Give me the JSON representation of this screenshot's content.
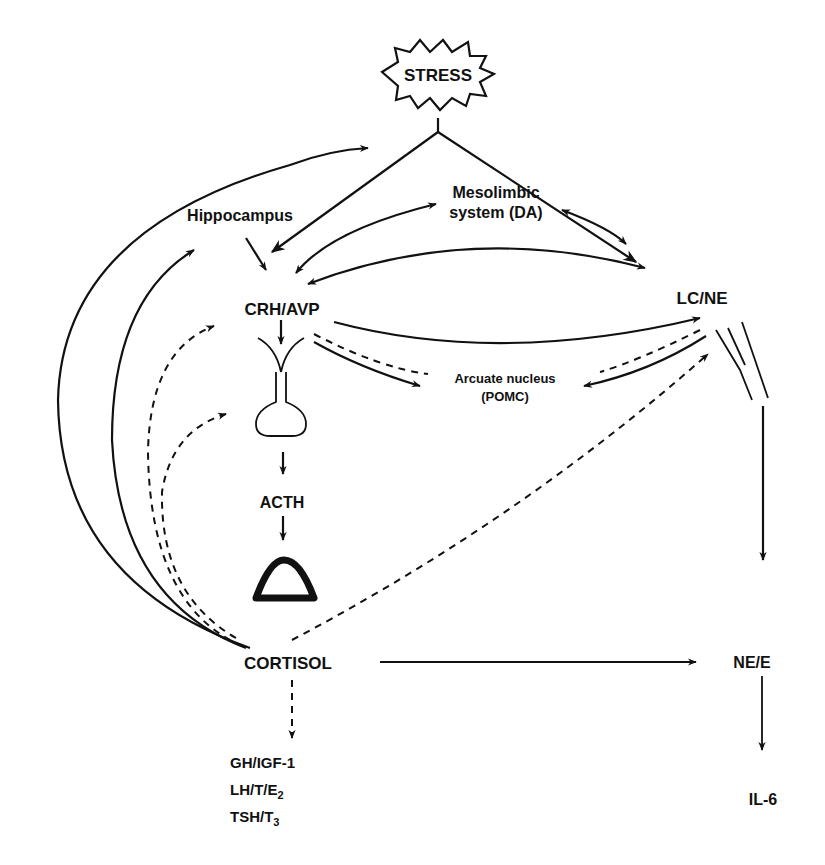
{
  "diagram": {
    "nodes": {
      "stress": "STRESS",
      "mesolimbic_line1": "Mesolimbic",
      "mesolimbic_line2": "system (DA)",
      "hippocampus": "Hippocampus",
      "crh_avp": "CRH/AVP",
      "lc_ne": "LC/NE",
      "arcuate_line1": "Arcuate nucleus",
      "arcuate_line2": "(POMC)",
      "acth": "ACTH",
      "cortisol": "CORTISOL",
      "ne_e": "NE/E",
      "il6": "IL-6",
      "gh_igf": "GH/IGF-1",
      "lh_base": "LH/T/E",
      "lh_sub": "2",
      "tsh_base": "TSH/T",
      "tsh_sub": "3"
    },
    "edges": [
      {
        "from": "STRESS",
        "to": "CRH/AVP",
        "style": "solid"
      },
      {
        "from": "STRESS",
        "to": "LC/NE",
        "style": "solid"
      },
      {
        "from": "Hippocampus",
        "to": "CRH/AVP",
        "style": "solid"
      },
      {
        "from": "Mesolimbic system (DA)",
        "to": "CRH/AVP",
        "style": "solid",
        "bidirectional": true
      },
      {
        "from": "Mesolimbic system (DA)",
        "to": "LC/NE",
        "style": "solid",
        "bidirectional": true
      },
      {
        "from": "CRH/AVP",
        "to": "LC/NE",
        "style": "solid",
        "bidirectional": true
      },
      {
        "from": "CRH/AVP",
        "to": "Arcuate nucleus (POMC)",
        "style": "solid"
      },
      {
        "from": "CRH/AVP",
        "to": "LC/NE",
        "style": "dashed"
      },
      {
        "from": "LC/NE",
        "to": "Arcuate nucleus (POMC)",
        "style": "solid"
      },
      {
        "from": "CRH/AVP",
        "to": "pituitary",
        "style": "solid"
      },
      {
        "from": "pituitary",
        "to": "ACTH",
        "style": "solid"
      },
      {
        "from": "ACTH",
        "to": "adrenal",
        "style": "solid"
      },
      {
        "from": "CORTISOL",
        "to": "STRESS",
        "style": "solid"
      },
      {
        "from": "CORTISOL",
        "to": "Hippocampus",
        "style": "solid"
      },
      {
        "from": "CORTISOL",
        "to": "CRH/AVP",
        "style": "dashed"
      },
      {
        "from": "CORTISOL",
        "to": "pituitary",
        "style": "dashed"
      },
      {
        "from": "CORTISOL",
        "to": "LC/NE",
        "style": "dashed"
      },
      {
        "from": "CORTISOL",
        "to": "NE/E",
        "style": "solid"
      },
      {
        "from": "CORTISOL",
        "to": "GH/IGF-1, LH/T/E2, TSH/T3",
        "style": "dashed"
      },
      {
        "from": "LC/NE",
        "to": "NE/E",
        "style": "solid"
      },
      {
        "from": "NE/E",
        "to": "IL-6",
        "style": "solid"
      }
    ]
  }
}
